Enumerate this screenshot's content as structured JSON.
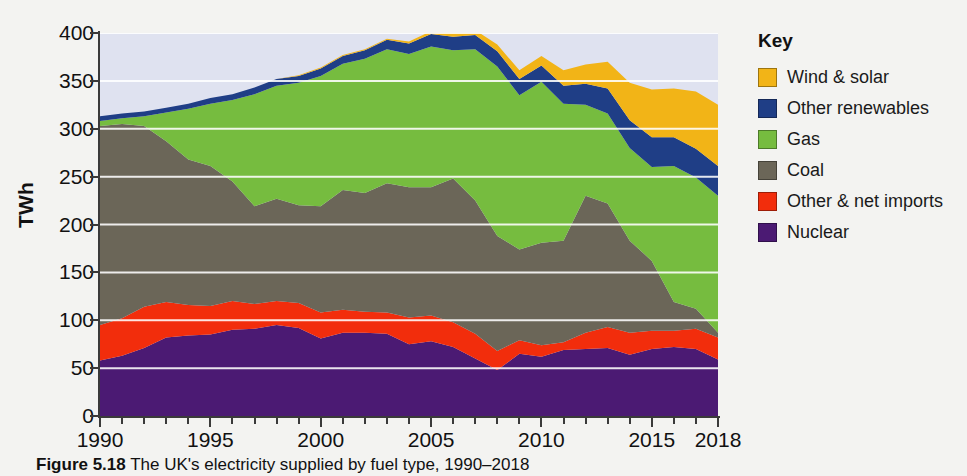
{
  "figure": {
    "caption_bold": "Figure 5.18",
    "caption_rest": " The UK's electricity supplied by fuel type, 1990–2018"
  },
  "legend": {
    "title": "Key",
    "items": [
      {
        "label": "Wind & solar",
        "color": "#F2B417"
      },
      {
        "label": "Other renewables",
        "color": "#1F3E86"
      },
      {
        "label": "Gas",
        "color": "#76BC3F"
      },
      {
        "label": "Coal",
        "color": "#6B6658"
      },
      {
        "label": "Other & net imports",
        "color": "#F22D0C"
      },
      {
        "label": "Nuclear",
        "color": "#4B1A73"
      }
    ]
  },
  "chart_data": {
    "type": "area",
    "stacked": true,
    "xlabel": "",
    "ylabel": "TWh",
    "xlim": [
      1990,
      2018
    ],
    "ylim": [
      0,
      400
    ],
    "yticks": [
      0,
      50,
      100,
      150,
      200,
      250,
      300,
      350,
      400
    ],
    "xticks": [
      1990,
      1995,
      2000,
      2005,
      2010,
      2015,
      2018
    ],
    "xtick_minor_step": 1,
    "grid": "horizontal-white",
    "plot_background": "#DFE2F0",
    "legend_position": "right",
    "x": [
      1990,
      1991,
      1992,
      1993,
      1994,
      1995,
      1996,
      1997,
      1998,
      1999,
      2000,
      2001,
      2002,
      2003,
      2004,
      2005,
      2006,
      2007,
      2008,
      2009,
      2010,
      2011,
      2012,
      2013,
      2014,
      2015,
      2016,
      2017,
      2018
    ],
    "series": [
      {
        "name": "Nuclear",
        "values": [
          58,
          63,
          71,
          82,
          84,
          85,
          90,
          91,
          95,
          92,
          81,
          87,
          87,
          86,
          75,
          78,
          72,
          60,
          48,
          65,
          62,
          69,
          70,
          71,
          64,
          70,
          72,
          70,
          59
        ]
      },
      {
        "name": "Other & net imports",
        "values": [
          37,
          39,
          43,
          37,
          32,
          30,
          30,
          26,
          25,
          26,
          27,
          24,
          22,
          22,
          28,
          27,
          26,
          26,
          20,
          14,
          12,
          8,
          17,
          22,
          23,
          19,
          17,
          21,
          23
        ]
      },
      {
        "name": "Coal",
        "values": [
          208,
          203,
          189,
          168,
          152,
          146,
          125,
          102,
          107,
          102,
          111,
          125,
          124,
          135,
          136,
          134,
          150,
          139,
          120,
          95,
          107,
          106,
          143,
          129,
          96,
          73,
          30,
          21,
          5
        ]
      },
      {
        "name": "Gas",
        "values": [
          5,
          6,
          10,
          30,
          53,
          65,
          85,
          117,
          118,
          128,
          136,
          132,
          140,
          140,
          139,
          147,
          134,
          158,
          177,
          161,
          168,
          143,
          95,
          94,
          97,
          98,
          142,
          137,
          143
        ]
      },
      {
        "name": "Other renewables",
        "values": [
          5,
          5,
          5,
          5,
          5,
          6,
          6,
          7,
          7,
          7,
          8,
          8,
          9,
          10,
          11,
          13,
          14,
          15,
          16,
          17,
          17,
          19,
          22,
          26,
          29,
          31,
          30,
          30,
          31
        ]
      },
      {
        "name": "Wind & solar",
        "values": [
          0,
          0,
          0,
          0,
          0,
          0,
          0,
          0,
          0,
          1,
          1,
          1,
          1,
          1,
          2,
          3,
          4,
          5,
          7,
          9,
          10,
          16,
          20,
          28,
          39,
          50,
          51,
          60,
          64
        ]
      }
    ]
  }
}
